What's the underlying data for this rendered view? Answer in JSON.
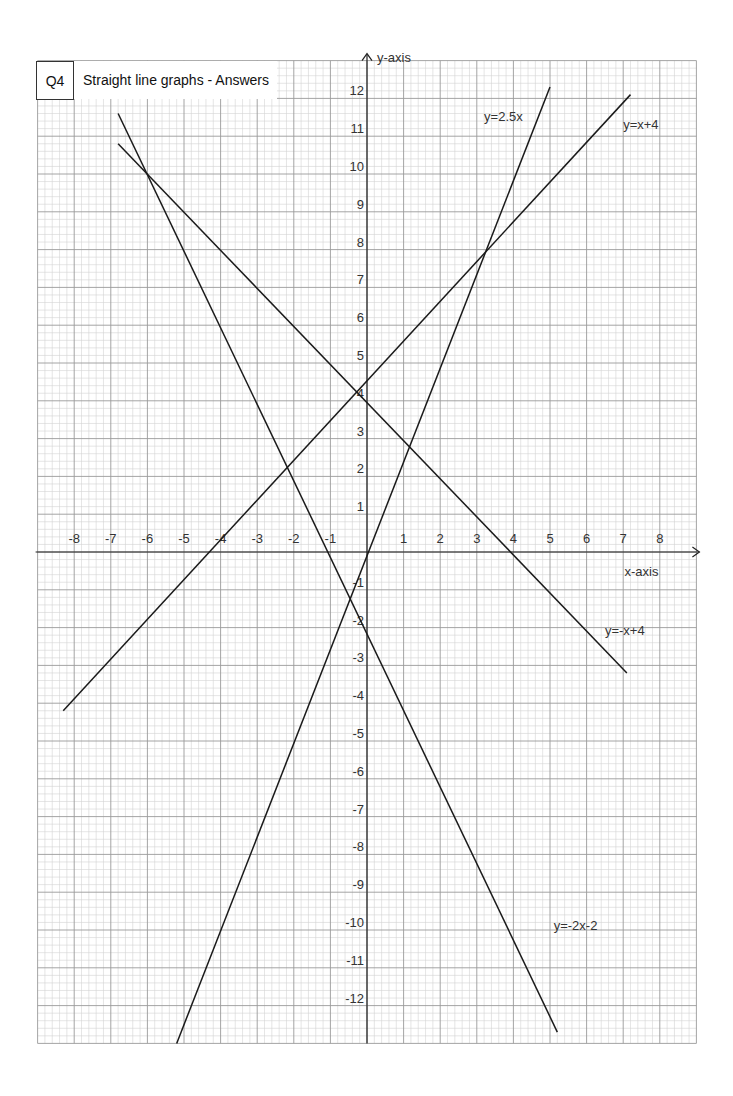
{
  "header": {
    "question": "Q4",
    "title": "Straight line graphs - Answers"
  },
  "chart_data": {
    "type": "line",
    "title": "Straight line graphs - Answers",
    "xlabel": "x-axis",
    "ylabel": "y-axis",
    "xlim": [
      -9,
      9
    ],
    "ylim": [
      -13,
      13
    ],
    "grid": true,
    "minor_divisions": 5,
    "x_ticks": [
      -8,
      -7,
      -6,
      -5,
      -4,
      -3,
      -2,
      -1,
      1,
      2,
      3,
      4,
      5,
      6,
      7,
      8
    ],
    "y_ticks": [
      12,
      11,
      10,
      9,
      8,
      7,
      6,
      5,
      4,
      3,
      2,
      1,
      -1,
      -2,
      -3,
      -4,
      -5,
      -6,
      -7,
      -8,
      -9,
      -10,
      -11,
      -12
    ],
    "series": [
      {
        "name": "y=2.5x",
        "x": [
          -5.2,
          5.0
        ],
        "y": [
          -13.0,
          12.3
        ],
        "label_pos": [
          3.2,
          11.4
        ]
      },
      {
        "name": "y=x+4",
        "x": [
          -8.3,
          7.2
        ],
        "y": [
          -4.2,
          12.1
        ],
        "label_pos": [
          7.0,
          11.2
        ]
      },
      {
        "name": "y=-x+4",
        "x": [
          -6.8,
          7.1
        ],
        "y": [
          10.8,
          -3.2
        ],
        "label_pos": [
          6.5,
          -2.2
        ]
      },
      {
        "name": "y=-2x-2",
        "x": [
          -6.8,
          5.2
        ],
        "y": [
          11.6,
          -12.7
        ],
        "label_pos": [
          5.1,
          -10.0
        ]
      }
    ]
  },
  "colors": {
    "grid_major": "#9a9a9a",
    "grid_minor": "#d4d4d4",
    "axis": "#222222",
    "line": "#1a1a1a"
  }
}
